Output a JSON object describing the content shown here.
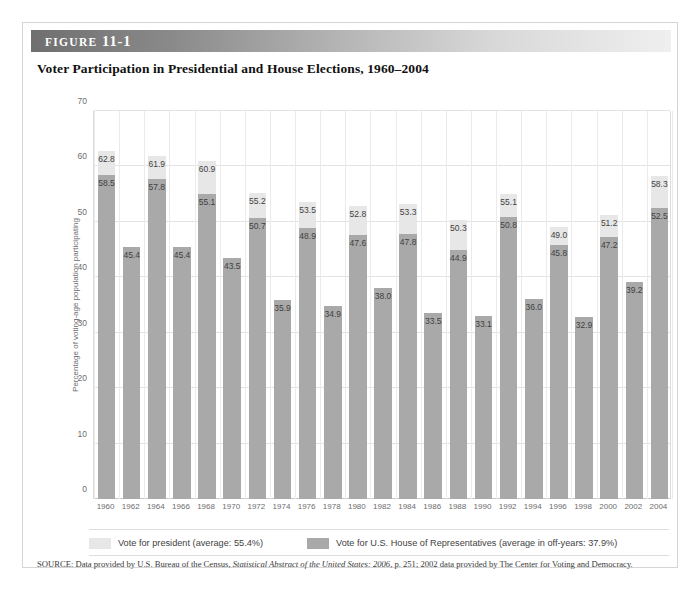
{
  "figure": {
    "label_word": "FIGURE",
    "label_number": "11-1",
    "title": "Voter Participation in Presidential and House Elections, 1960–2004"
  },
  "source": {
    "prefix": "SOURCE: Data provided by U.S. Bureau of the Census, ",
    "italic": "Statistical Abstract of the United States: 2006",
    "suffix": ", p. 251; 2002 data provided by The Center for Voting and Democracy."
  },
  "legend": {
    "president_label": "Vote for president (average: 55.4%)",
    "house_label": "Vote for U.S. House of Representatives (average in off-years: 37.9%)",
    "president_color": "#e7e7e7",
    "house_color": "#a9a9a9"
  },
  "chart_data": {
    "type": "bar",
    "title": "Voter Participation in Presidential and House Elections, 1960–2004",
    "xlabel": "",
    "ylabel": "Percentage of voting-age population participating",
    "ylim": [
      0,
      70
    ],
    "yticks": [
      0,
      10,
      20,
      30,
      40,
      50,
      60,
      70
    ],
    "grid": true,
    "legend_position": "bottom",
    "stacked": false,
    "categories": [
      "1960",
      "1962",
      "1964",
      "1966",
      "1968",
      "1970",
      "1972",
      "1974",
      "1976",
      "1978",
      "1980",
      "1982",
      "1984",
      "1986",
      "1988",
      "1990",
      "1992",
      "1994",
      "1996",
      "1998",
      "2000",
      "2002",
      "2004"
    ],
    "series": [
      {
        "name": "Vote for president (average: 55.4%)",
        "color": "#e7e7e7",
        "values": [
          62.8,
          null,
          61.9,
          null,
          60.9,
          null,
          55.2,
          null,
          53.5,
          null,
          52.8,
          null,
          53.3,
          null,
          50.3,
          null,
          55.1,
          null,
          49.0,
          null,
          51.2,
          null,
          58.3
        ]
      },
      {
        "name": "Vote for U.S. House of Representatives (average in off-years: 37.9%)",
        "color": "#a9a9a9",
        "values": [
          58.5,
          45.4,
          57.8,
          45.4,
          55.1,
          43.5,
          50.7,
          35.9,
          48.9,
          34.9,
          47.6,
          38.0,
          47.8,
          33.5,
          44.9,
          33.1,
          50.8,
          36.0,
          45.8,
          32.9,
          47.2,
          39.2,
          52.5
        ]
      }
    ],
    "averages": {
      "president": 55.4,
      "house_off_years": 37.9
    }
  }
}
